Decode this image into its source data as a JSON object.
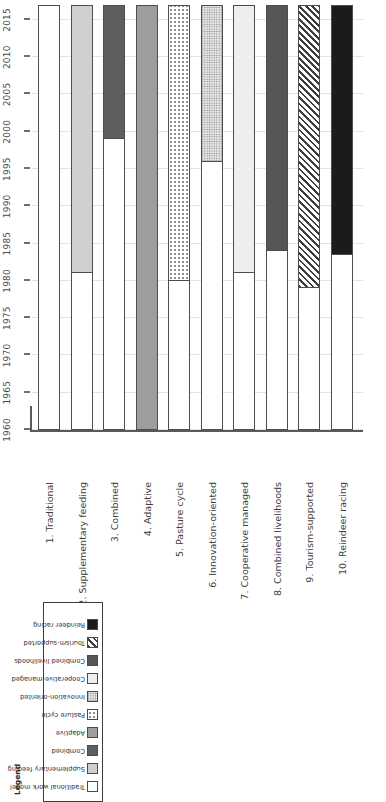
{
  "chart_data": {
    "type": "bar",
    "orientation": "horizontal-time",
    "title": "",
    "xlabel": "",
    "ylabel": "",
    "xlim": [
      1960,
      2017
    ],
    "grid": true,
    "ticks": [
      "1960",
      "1965",
      "1970",
      "1975",
      "1980",
      "1985",
      "1990",
      "1995",
      "2000",
      "2005",
      "2010",
      "2015"
    ],
    "tick_values": [
      1960,
      1965,
      1970,
      1975,
      1980,
      1985,
      1990,
      1995,
      2000,
      2005,
      2010,
      2015
    ],
    "categories": [
      "1. Traditional",
      "2. Supplementary feeding",
      "3. Combined",
      "4. Adaptive",
      "5. Pasture cycle",
      "6. Innovation-oriented",
      "7. Cooperative managed",
      "8. Combined livelihoods",
      "9. Tourism-supported",
      "10. Reindeer racing"
    ],
    "bars": [
      {
        "label": "1. Traditional",
        "start": 1960,
        "end": 2017,
        "fill": "white"
      },
      {
        "label": "2. Supplementary feeding",
        "start": 1981,
        "end": 2017,
        "fill": "ltgray"
      },
      {
        "label": "3. Combined",
        "start": 1999,
        "end": 2017,
        "fill": "dkgray2"
      },
      {
        "label": "4. Adaptive",
        "start": 1960,
        "end": 2017,
        "fill": "midgray"
      },
      {
        "label": "5. Pasture cycle",
        "start": 1980,
        "end": 2017,
        "fill": "dots"
      },
      {
        "label": "6. Innovation-oriented",
        "start": 1996,
        "end": 2017,
        "fill": "grid"
      },
      {
        "label": "7. Cooperative managed",
        "start": 1981,
        "end": 2017,
        "fill": "vlight"
      },
      {
        "label": "8. Combined livelihoods",
        "start": 1984,
        "end": 2017,
        "fill": "dkgray"
      },
      {
        "label": "9. Tourism-supported",
        "start": 1979,
        "end": 2017,
        "fill": "hatch"
      },
      {
        "label": "10. Reindeer racing",
        "start": 1983.5,
        "end": 2017,
        "fill": "black"
      }
    ]
  },
  "legend": {
    "title": "Legend",
    "items": [
      {
        "label": "Traditional work model",
        "fill": "white"
      },
      {
        "label": "Supplementary feeding",
        "fill": "ltgray"
      },
      {
        "label": "Combined",
        "fill": "dkgray2"
      },
      {
        "label": "Adaptive",
        "fill": "midgray"
      },
      {
        "label": "Pasture cycle",
        "fill": "dots"
      },
      {
        "label": "Innovation-oriented",
        "fill": "grid"
      },
      {
        "label": "Cooperative-managed",
        "fill": "vlight"
      },
      {
        "label": "Combined livelihoods",
        "fill": "dkgray"
      },
      {
        "label": "Tourism-supported",
        "fill": "hatch"
      },
      {
        "label": "Reindeer racing",
        "fill": "black"
      }
    ]
  },
  "colors": {
    "white": "#ffffff",
    "ltgray": "#cfcfcf",
    "dkgray2": "#5e5e5e",
    "midgray": "#9d9d9d",
    "vlight": "#eeeeee",
    "dkgray": "#565656",
    "black": "#1b1b1b",
    "outline": "#4d4d4d",
    "grid": "#e2e2e2"
  }
}
